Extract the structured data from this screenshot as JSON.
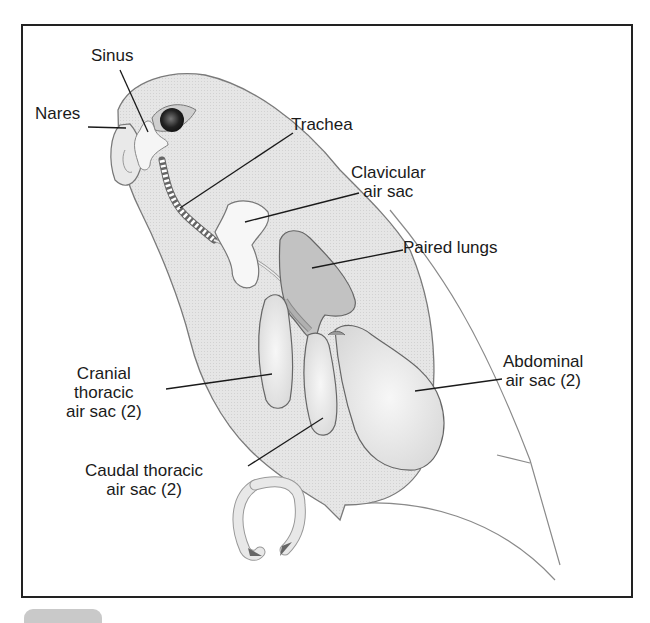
{
  "figure": {
    "labels": [
      {
        "id": "sinus",
        "text": "Sinus"
      },
      {
        "id": "nares",
        "text": "Nares"
      },
      {
        "id": "trachea",
        "text": "Trachea"
      },
      {
        "id": "clavicular",
        "text": "Clavicular\nair sac"
      },
      {
        "id": "lungs",
        "text": "Paired lungs"
      },
      {
        "id": "abdominal",
        "text": "Abdominal\nair sac (2)"
      },
      {
        "id": "cranial",
        "text": "Cranial\nthoracic\nair sac (2)"
      },
      {
        "id": "caudal",
        "text": "Caudal thoracic\nair sac (2)"
      }
    ],
    "colors": {
      "frame": "#222222",
      "body_fill": "#e4e4e4",
      "organ_fill": "#f2f2f2",
      "lung_fill": "#bdbdbd",
      "outline": "#6a6a6a",
      "leader": "#1a1a1a"
    }
  }
}
